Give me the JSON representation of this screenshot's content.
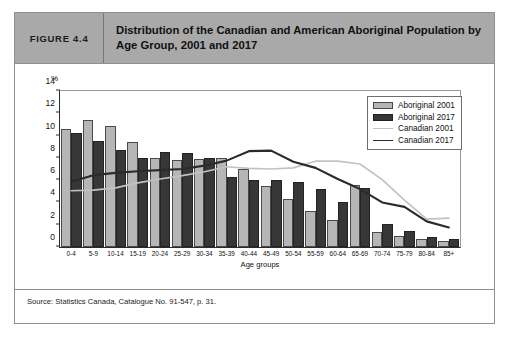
{
  "figure": {
    "number_label": "FIGURE 4.4",
    "title": "Distribution of the Canadian and American Aboriginal Population by Age Group, 2001 and 2017",
    "source": "Source: Statistics Canada, Catalogue No. 91-547, p. 31."
  },
  "colors": {
    "header_background": "#a9a9a9",
    "aboriginal_2001": "#b6b6b6",
    "aboriginal_2017": "#373737",
    "canadian_2001": "#c2c2c2",
    "canadian_2017": "#2b2b2b",
    "frame": "#8f8f8f",
    "axis": "#2b2b2b"
  },
  "chart_data": {
    "type": "bar",
    "title": "Distribution of the Canadian and American Aboriginal Population by Age Group, 2001 and 2017",
    "xlabel": "Age groups",
    "ylabel": "%",
    "ylim": [
      0,
      14
    ],
    "yticks": [
      0,
      2,
      4,
      6,
      8,
      10,
      12,
      14
    ],
    "grid": false,
    "legend_position": "top-right",
    "categories": [
      "0-4",
      "5-9",
      "10-14",
      "15-19",
      "20-24",
      "25-29",
      "30-34",
      "35-39",
      "40-44",
      "45-49",
      "50-54",
      "55-59",
      "60-64",
      "65-69",
      "70-74",
      "75-79",
      "80-84",
      "85+"
    ],
    "series": [
      {
        "name": "Aboriginal 2001",
        "style": "bar",
        "color": "#b6b6b6",
        "values": [
          10.6,
          11.4,
          10.85,
          9.4,
          8.0,
          7.85,
          7.9,
          7.95,
          7.0,
          5.5,
          4.35,
          3.2,
          2.4,
          5.6,
          1.35,
          1.0,
          0.7,
          0.5
        ]
      },
      {
        "name": "Aboriginal 2017",
        "style": "bar",
        "color": "#373737",
        "values": [
          10.2,
          9.5,
          8.7,
          7.95,
          8.55,
          8.4,
          7.95,
          6.25,
          6.0,
          6.05,
          5.85,
          5.25,
          4.0,
          5.3,
          2.1,
          1.4,
          0.9,
          0.75
        ]
      },
      {
        "name": "Canadian 2001",
        "style": "line",
        "color": "#c2c2c2",
        "values": [
          5.05,
          5.1,
          5.3,
          5.75,
          6.1,
          6.4,
          6.75,
          7.2,
          7.05,
          7.0,
          7.1,
          7.7,
          7.7,
          7.45,
          6.05,
          4.2,
          2.5,
          2.6
        ]
      },
      {
        "name": "Canadian 2017",
        "style": "line",
        "color": "#2b2b2b",
        "values": [
          5.85,
          6.45,
          6.65,
          6.8,
          6.9,
          7.0,
          7.3,
          7.75,
          8.6,
          8.65,
          7.65,
          7.1,
          6.1,
          5.2,
          4.0,
          3.6,
          2.3,
          1.75
        ]
      }
    ]
  },
  "legend": {
    "entries": [
      {
        "label": "Aboriginal 2001"
      },
      {
        "label": "Aboriginal 2017"
      },
      {
        "label": "Canadian 2001"
      },
      {
        "label": "Canadian 2017"
      }
    ]
  }
}
